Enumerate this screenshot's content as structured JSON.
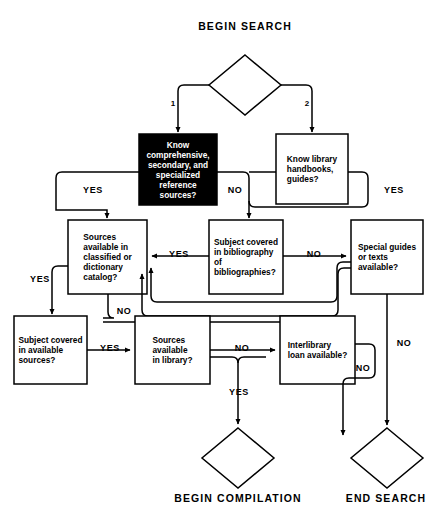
{
  "diagram": {
    "type": "flowchart",
    "background_color": "#ffffff",
    "line_color": "#000000"
  },
  "terminals": {
    "begin_search": "BEGIN SEARCH",
    "begin_compilation": "BEGIN COMPILATION",
    "end_search": "END SEARCH"
  },
  "branch_numbers": {
    "one": "1",
    "two": "2"
  },
  "nodes": {
    "know_reference_sources": {
      "text": "Know\ncomprehensive,\nsecondary, and\nspecialized\nreference\nsources?",
      "fill": "#000000",
      "text_color": "#ffffff"
    },
    "know_handbooks": {
      "text": "Know library\nhandbooks,\nguides?",
      "fill": "#ffffff",
      "text_color": "#000000"
    },
    "catalog": {
      "text": "Sources\navailable in\nclassified or\ndictionary\ncatalog?",
      "fill": "#ffffff",
      "text_color": "#000000"
    },
    "bibliography": {
      "text": "Subject covered\nin bibliography\nof\nbibliographies?",
      "fill": "#ffffff",
      "text_color": "#000000"
    },
    "special_guides": {
      "text": "Special guides\nor texts\navailable?",
      "fill": "#ffffff",
      "text_color": "#000000"
    },
    "available_sources": {
      "text": "Subject covered\nin available\nsources?",
      "fill": "#ffffff",
      "text_color": "#000000"
    },
    "in_library": {
      "text": "Sources\navailable\nin library?",
      "fill": "#ffffff",
      "text_color": "#000000"
    },
    "interlibrary": {
      "text": "Interlibrary\nloan available?",
      "fill": "#ffffff",
      "text_color": "#000000"
    }
  },
  "edge_labels": {
    "ref_yes": "YES",
    "ref_no": "NO",
    "handbooks_yes": "YES",
    "biblio_yes": "YES",
    "biblio_no": "NO",
    "catalog_yes": "YES",
    "catalog_no": "NO",
    "avail_yes": "YES",
    "library_no": "NO",
    "library_yes": "YES",
    "interlibrary_no": "NO",
    "special_no": "NO"
  }
}
